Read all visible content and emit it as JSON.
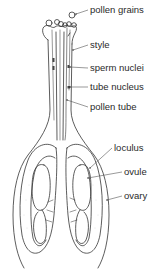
{
  "diagram": {
    "labels": [
      {
        "id": "pollen-grains",
        "text": "pollen grains",
        "x": 90,
        "y": 5
      },
      {
        "id": "style",
        "text": "style",
        "x": 90,
        "y": 40
      },
      {
        "id": "sperm-nuclei",
        "text": "sperm nuclei",
        "x": 90,
        "y": 63
      },
      {
        "id": "tube-nucleus",
        "text": "tube nucleus",
        "x": 90,
        "y": 82
      },
      {
        "id": "pollen-tube",
        "text": "pollen tube",
        "x": 90,
        "y": 102
      },
      {
        "id": "loculus",
        "text": "loculus",
        "x": 114,
        "y": 143
      },
      {
        "id": "ovule",
        "text": "ovule",
        "x": 124,
        "y": 167
      },
      {
        "id": "ovary",
        "text": "ovary",
        "x": 124,
        "y": 191
      }
    ],
    "colors": {
      "line": "#333333",
      "text": "#2a2a2a",
      "background": "#ffffff",
      "stipple": "#bbbbbb"
    }
  }
}
